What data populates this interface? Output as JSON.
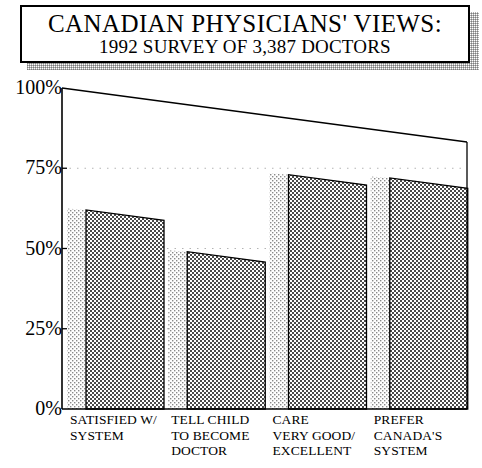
{
  "title": {
    "line1": "CANADIAN PHYSICIANS' VIEWS:",
    "line2": "1992 SURVEY OF 3,387 DOCTORS"
  },
  "chart_data": {
    "type": "bar",
    "title": "CANADIAN PHYSICIANS' VIEWS: 1992 SURVEY OF 3,387 DOCTORS",
    "subtitle": "1992 SURVEY OF 3,387 DOCTORS",
    "xlabel": "",
    "ylabel": "",
    "ylim": [
      0,
      100
    ],
    "yunit": "%",
    "grid": "dotted-horizontal",
    "legend": "none",
    "style": "3d-perspective-dither-bars",
    "categories": [
      "SATISFIED W/ SYSTEM",
      "TELL CHILD TO BECOME DOCTOR",
      "CARE VERY GOOD/ EXCELLENT",
      "PREFER CANADA'S SYSTEM"
    ],
    "category_lines": [
      [
        "SATISFIED W/",
        "SYSTEM"
      ],
      [
        "TELL CHILD",
        "TO BECOME",
        "DOCTOR"
      ],
      [
        "CARE",
        "VERY GOOD/",
        "EXCELLENT"
      ],
      [
        "PREFER",
        "CANADA'S",
        "SYSTEM"
      ]
    ],
    "values": [
      62,
      49,
      73,
      72
    ],
    "yticks": [
      0,
      25,
      50,
      75,
      100
    ],
    "ytick_labels": [
      "0%",
      "25%",
      "50%",
      "75%",
      "100%"
    ]
  },
  "colors": {
    "ink": "#000000",
    "paper": "#ffffff",
    "bar_face": "#8c8c8c",
    "bar_side": "#d8d8d8",
    "grid": "#b4b4b4"
  }
}
